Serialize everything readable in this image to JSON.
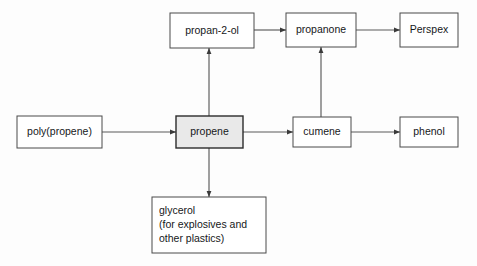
{
  "diagram": {
    "background_color": "#fdfdfd",
    "box_fill": "#ffffff",
    "box_stroke": "#4a4a4a",
    "highlight_fill": "#e9e9e9",
    "edge_color": "#5a5a5a",
    "text_color": "#16181a",
    "nodes": [
      {
        "id": "propan-2-ol",
        "label": "propan-2-ol",
        "x": 170,
        "y": 13,
        "w": 84,
        "h": 35,
        "align": "centered",
        "highlight": false
      },
      {
        "id": "propanone",
        "label": "propanone",
        "x": 286,
        "y": 13,
        "w": 70,
        "h": 34,
        "align": "centered",
        "highlight": false
      },
      {
        "id": "perspex",
        "label": "Perspex",
        "x": 400,
        "y": 13,
        "w": 58,
        "h": 34,
        "align": "centered",
        "highlight": false
      },
      {
        "id": "poly-propene",
        "label": "poly(propene)",
        "x": 17,
        "y": 116,
        "w": 85,
        "h": 32,
        "align": "centered",
        "highlight": false
      },
      {
        "id": "propene",
        "label": "propene",
        "x": 176,
        "y": 116,
        "w": 67,
        "h": 32,
        "align": "centered",
        "highlight": true
      },
      {
        "id": "cumene",
        "label": "cumene",
        "x": 293,
        "y": 117,
        "w": 58,
        "h": 30,
        "align": "centered",
        "highlight": false
      },
      {
        "id": "phenol",
        "label": "phenol",
        "x": 400,
        "y": 117,
        "w": 58,
        "h": 30,
        "align": "centered",
        "highlight": false
      }
    ],
    "glycerol_node": {
      "id": "glycerol",
      "x": 152,
      "y": 197,
      "w": 114,
      "h": 56,
      "lines": [
        "glycerol",
        "(for explosives and",
        "other plastics)"
      ]
    },
    "edges": [
      {
        "id": "poly-propene-to-propene",
        "from": "poly(propene)",
        "to": "propene",
        "direction": "right",
        "x1": 102,
        "y1": 132,
        "x2": 176,
        "y2": 132
      },
      {
        "id": "propene-to-cumene",
        "from": "propene",
        "to": "cumene",
        "direction": "right",
        "x1": 243,
        "y1": 132,
        "x2": 293,
        "y2": 132
      },
      {
        "id": "cumene-to-phenol",
        "from": "cumene",
        "to": "phenol",
        "direction": "right",
        "x1": 351,
        "y1": 132,
        "x2": 400,
        "y2": 132
      },
      {
        "id": "propan-2-ol-to-propanone",
        "from": "propan-2-ol",
        "to": "propanone",
        "direction": "right",
        "x1": 254,
        "y1": 30,
        "x2": 286,
        "y2": 30
      },
      {
        "id": "propanone-to-perspex",
        "from": "propanone",
        "to": "Perspex",
        "direction": "right",
        "x1": 356,
        "y1": 30,
        "x2": 400,
        "y2": 30
      },
      {
        "id": "propene-to-propan-2-ol",
        "from": "propene",
        "to": "propan-2-ol",
        "direction": "up",
        "x1": 209,
        "y1": 116,
        "x2": 209,
        "y2": 48
      },
      {
        "id": "cumene-to-propanone",
        "from": "cumene",
        "to": "propanone",
        "direction": "up",
        "x1": 321,
        "y1": 117,
        "x2": 321,
        "y2": 47
      },
      {
        "id": "propene-to-glycerol",
        "from": "propene",
        "to": "glycerol",
        "direction": "down",
        "x1": 209,
        "y1": 148,
        "x2": 209,
        "y2": 197
      }
    ]
  }
}
